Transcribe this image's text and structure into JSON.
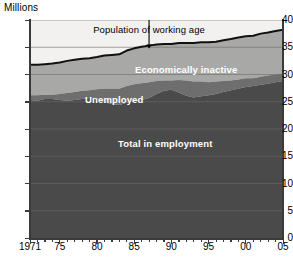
{
  "axis_unit_label": "Millions",
  "y_ticks": [
    "40",
    "35",
    "30",
    "25",
    "20",
    "15",
    "10",
    "5",
    "0"
  ],
  "x_ticks": [
    "1971",
    "75",
    "80",
    "85",
    "90",
    "95",
    "00",
    "05"
  ],
  "labels": {
    "working_age": "Population of working age",
    "inactive": "Economically inactive",
    "unemployed": "Unemployed",
    "employment": "Total in employment"
  },
  "colors": {
    "plot_background": "#f2f1ef",
    "employment": "#4a4a4a",
    "unemployed": "#6e6e6e",
    "inactive": "#a8a8a6",
    "working_age_line": "#111111",
    "gridline": "#6b6b6b",
    "axis": "#3a3a3a"
  },
  "chart_data": {
    "type": "area",
    "title": "",
    "subtitle": "",
    "xlabel": "",
    "ylabel": "Millions",
    "ylim": [
      0,
      40
    ],
    "xlim": [
      1971,
      2005
    ],
    "grid": true,
    "legend_position": "inline-labels",
    "stacked": true,
    "annotations": [
      {
        "text": "Population of working age",
        "x": 1987,
        "y": 38.2,
        "arrow_to_x": 1987,
        "arrow_to_y": 34.6
      }
    ],
    "x": [
      1971,
      1972,
      1973,
      1974,
      1975,
      1976,
      1977,
      1978,
      1979,
      1980,
      1981,
      1982,
      1983,
      1984,
      1985,
      1986,
      1987,
      1988,
      1989,
      1990,
      1991,
      1992,
      1993,
      1994,
      1995,
      1996,
      1997,
      1998,
      1999,
      2000,
      2001,
      2002,
      2003,
      2004,
      2005
    ],
    "series": [
      {
        "name": "Total in employment",
        "values": [
          25.3,
          25.2,
          25.5,
          25.5,
          25.3,
          25.2,
          25.3,
          25.5,
          25.7,
          25.6,
          24.9,
          24.6,
          24.4,
          24.8,
          25.1,
          25.3,
          25.7,
          26.4,
          27.0,
          27.2,
          26.7,
          26.1,
          25.8,
          26.0,
          26.2,
          26.4,
          26.8,
          27.1,
          27.4,
          27.7,
          27.9,
          28.1,
          28.3,
          28.6,
          28.8
        ]
      },
      {
        "name": "Unemployed",
        "values": [
          0.9,
          1.0,
          0.8,
          0.8,
          1.1,
          1.4,
          1.5,
          1.5,
          1.4,
          1.7,
          2.5,
          2.8,
          3.0,
          3.1,
          3.1,
          3.1,
          2.9,
          2.4,
          1.9,
          1.7,
          2.3,
          2.8,
          2.9,
          2.7,
          2.4,
          2.3,
          2.0,
          1.8,
          1.7,
          1.6,
          1.4,
          1.5,
          1.5,
          1.4,
          1.4
        ]
      },
      {
        "name": "Economically inactive",
        "values": [
          5.6,
          5.6,
          5.6,
          5.7,
          5.8,
          5.9,
          5.9,
          5.9,
          5.9,
          5.9,
          6.1,
          6.2,
          6.3,
          6.5,
          6.6,
          6.7,
          6.7,
          6.7,
          6.7,
          6.7,
          6.8,
          6.9,
          7.1,
          7.2,
          7.3,
          7.3,
          7.5,
          7.6,
          7.7,
          7.7,
          7.8,
          7.9,
          7.9,
          8.0,
          8.0
        ]
      }
    ],
    "total_line": {
      "name": "Population of working age",
      "values": [
        31.8,
        31.8,
        31.9,
        32.0,
        32.2,
        32.5,
        32.7,
        32.9,
        33.0,
        33.2,
        33.5,
        33.6,
        33.7,
        34.4,
        34.8,
        35.1,
        35.3,
        35.5,
        35.6,
        35.6,
        35.8,
        35.8,
        35.8,
        35.9,
        35.9,
        36.0,
        36.3,
        36.5,
        36.8,
        37.0,
        37.1,
        37.5,
        37.7,
        38.0,
        38.2
      ]
    }
  }
}
